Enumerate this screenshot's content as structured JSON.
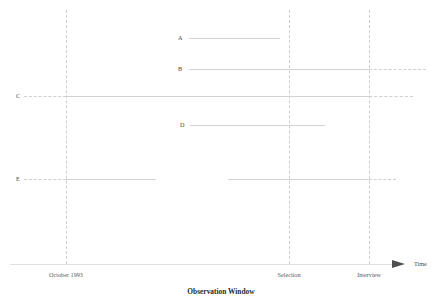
{
  "figure": {
    "axis_title": "Observation Window",
    "time_axis_label": "Time",
    "tick_labels": [
      {
        "text": "October 1993",
        "x": 66
      },
      {
        "text": "Selection",
        "x": 289
      },
      {
        "text": "Interview",
        "x": 369
      }
    ],
    "row_labels": [
      "A",
      "B",
      "C",
      "D",
      "E"
    ],
    "top_clipped_text": ""
  },
  "chart_data": {
    "type": "line",
    "title": "",
    "subtitle": "",
    "xlabel": "Observation Window",
    "ylabel": "",
    "grid": true,
    "legend_position": "none",
    "axis_arrow_label": "Time",
    "x_ticks": [
      {
        "label": "October 1993",
        "px": 66
      },
      {
        "label": "Selection",
        "px": 289
      },
      {
        "label": "Interview",
        "px": 369
      }
    ],
    "x_axis": {
      "start_px": 10,
      "end_px": 400,
      "y_px": 264
    },
    "vertical_reference_lines": [
      {
        "name": "October 1993",
        "x_px": 66,
        "style": "dashed",
        "top_px": 10,
        "bottom_px": 264
      },
      {
        "name": "Selection",
        "x_px": 289,
        "style": "dashed",
        "top_px": 10,
        "bottom_px": 264
      },
      {
        "name": "Interview",
        "x_px": 369,
        "style": "dashed",
        "top_px": 10,
        "bottom_px": 264
      }
    ],
    "series": [
      {
        "name": "A",
        "label_x_px": 178,
        "y_px": 38,
        "segments": [
          {
            "from_px": 189,
            "to_px": 280,
            "style": "solid"
          }
        ]
      },
      {
        "name": "B",
        "label_x_px": 178,
        "y_px": 69,
        "segments": [
          {
            "from_px": 189,
            "to_px": 369,
            "style": "solid"
          },
          {
            "from_px": 369,
            "to_px": 426,
            "style": "dashed"
          }
        ]
      },
      {
        "name": "C",
        "label_x_px": 16,
        "y_px": 96,
        "segments": [
          {
            "from_px": 24,
            "to_px": 66,
            "style": "dashed"
          },
          {
            "from_px": 66,
            "to_px": 369,
            "style": "solid"
          },
          {
            "from_px": 369,
            "to_px": 413,
            "style": "dashed"
          }
        ]
      },
      {
        "name": "D",
        "label_x_px": 180,
        "y_px": 125,
        "segments": [
          {
            "from_px": 190,
            "to_px": 325,
            "style": "solid"
          }
        ]
      },
      {
        "name": "E",
        "label_x_px": 16,
        "y_px": 179,
        "segments": [
          {
            "from_px": 24,
            "to_px": 66,
            "style": "dashed"
          },
          {
            "from_px": 66,
            "to_px": 156,
            "style": "solid"
          },
          {
            "from_px": 228,
            "to_px": 369,
            "style": "solid"
          },
          {
            "from_px": 369,
            "to_px": 396,
            "style": "dashed"
          }
        ]
      }
    ]
  }
}
